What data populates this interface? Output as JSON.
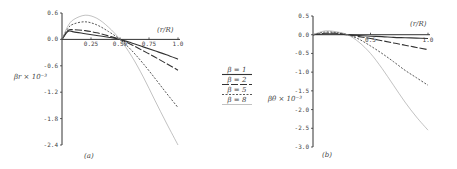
{
  "chart_data": [
    {
      "type": "line",
      "panel": "(a)",
      "xlabel": "(r/R)",
      "ylabel": "βr × 10⁻³",
      "xlim": [
        0,
        1.0
      ],
      "ylim": [
        -2.4,
        0.6
      ],
      "xticks": [
        "0.25",
        "0.50",
        "0.75",
        "1.0"
      ],
      "yticks": [
        "0.6",
        "0.0",
        "-0.6",
        "-1.2",
        "-1.8",
        "-2.4"
      ],
      "x": [
        0,
        0.05,
        0.1,
        0.2,
        0.3,
        0.4,
        0.5,
        0.6,
        0.7,
        0.8,
        0.9,
        1.0
      ],
      "series": [
        {
          "name": "β = 1",
          "style": "solid",
          "values": [
            0.0,
            0.18,
            0.17,
            0.13,
            0.09,
            0.05,
            0.0,
            -0.08,
            -0.17,
            -0.26,
            -0.35,
            -0.45
          ]
        },
        {
          "name": "β = 2",
          "style": "long-dash",
          "values": [
            0.0,
            0.2,
            0.22,
            0.2,
            0.15,
            0.08,
            0.0,
            -0.12,
            -0.26,
            -0.4,
            -0.55,
            -0.7
          ]
        },
        {
          "name": "β = 5",
          "style": "dash",
          "values": [
            0.0,
            0.25,
            0.35,
            0.4,
            0.33,
            0.18,
            0.0,
            -0.25,
            -0.55,
            -0.88,
            -1.22,
            -1.55
          ]
        },
        {
          "name": "β = 8",
          "style": "dotted",
          "values": [
            0.0,
            0.3,
            0.45,
            0.55,
            0.48,
            0.28,
            0.0,
            -0.38,
            -0.85,
            -1.38,
            -1.9,
            -2.4
          ]
        }
      ],
      "grid": false
    },
    {
      "type": "line",
      "panel": "(b)",
      "xlabel": "(r/R)",
      "ylabel": "βθ × 10⁻³",
      "xlim": [
        0,
        1.0
      ],
      "ylim": [
        -3.0,
        0.5
      ],
      "xticks": [
        "0.5",
        "1.0"
      ],
      "yticks": [
        "0.5",
        "0.0",
        "-0.5",
        "-1.0",
        "-1.5",
        "-2.0",
        "-2.5",
        "-3.0"
      ],
      "x": [
        0,
        0.1,
        0.2,
        0.3,
        0.4,
        0.5,
        0.6,
        0.7,
        0.8,
        0.9,
        1.0
      ],
      "series": [
        {
          "name": "β = 1",
          "style": "solid",
          "values": [
            0.0,
            0.02,
            0.02,
            0.0,
            -0.02,
            -0.04,
            -0.05,
            -0.07,
            -0.08,
            -0.09,
            -0.1
          ]
        },
        {
          "name": "β = 2",
          "style": "long-dash",
          "values": [
            0.0,
            0.04,
            0.04,
            0.0,
            -0.05,
            -0.1,
            -0.16,
            -0.22,
            -0.28,
            -0.34,
            -0.4
          ]
        },
        {
          "name": "β = 5",
          "style": "dash",
          "values": [
            0.0,
            0.07,
            0.06,
            0.0,
            -0.12,
            -0.3,
            -0.5,
            -0.72,
            -0.95,
            -1.15,
            -1.35
          ]
        },
        {
          "name": "β = 8",
          "style": "dotted",
          "values": [
            0.0,
            0.1,
            0.08,
            0.0,
            -0.2,
            -0.5,
            -0.9,
            -1.35,
            -1.8,
            -2.2,
            -2.55
          ]
        }
      ],
      "grid": false
    }
  ],
  "legend": {
    "items": [
      {
        "label": "β = 1",
        "style": "solid"
      },
      {
        "label": "β = 2",
        "style": "long-dash"
      },
      {
        "label": "β = 5",
        "style": "dash"
      },
      {
        "label": "β = 8",
        "style": "dotted"
      }
    ]
  },
  "labels": {
    "panel_a": "(a)",
    "panel_b": "(b)",
    "a_ylabel": "βr × 10⁻³",
    "b_ylabel": "βθ × 10⁻³",
    "xlabel": "(r/R)"
  }
}
